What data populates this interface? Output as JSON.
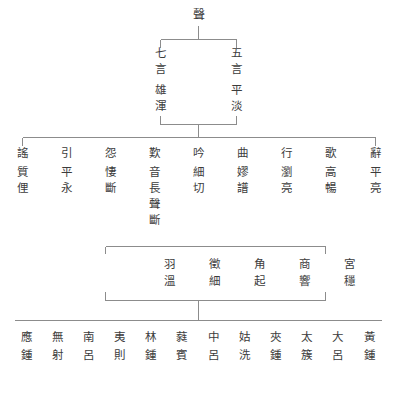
{
  "diagram": {
    "title": "聲",
    "type": "tree",
    "root": {
      "label": "聲",
      "chars": [
        "聲"
      ]
    },
    "level1": [
      {
        "label": "七言雄渾",
        "chars": [
          "七",
          "言",
          "雄",
          "渾"
        ]
      },
      {
        "label": "五言平淡",
        "chars": [
          "五",
          "言",
          "平",
          "淡"
        ]
      }
    ],
    "level2": [
      {
        "label": "謠質俚",
        "chars": [
          "謠",
          "質",
          "俚"
        ]
      },
      {
        "label": "引平永",
        "chars": [
          "引",
          "平",
          "永"
        ]
      },
      {
        "label": "怨悽斷",
        "chars": [
          "怨",
          "悽",
          "斷"
        ]
      },
      {
        "label": "歎音長聲斷",
        "chars": [
          "歎",
          "音",
          "長",
          "聲",
          "斷"
        ]
      },
      {
        "label": "吟細切",
        "chars": [
          "吟",
          "細",
          "切"
        ]
      },
      {
        "label": "曲嫪譜",
        "chars": [
          "曲",
          "嫪",
          "譜"
        ]
      },
      {
        "label": "行瀏亮",
        "chars": [
          "行",
          "瀏",
          "亮"
        ]
      },
      {
        "label": "歌高暢",
        "chars": [
          "歌",
          "高",
          "暢"
        ]
      },
      {
        "label": "辭平亮",
        "chars": [
          "辭",
          "平",
          "亮"
        ]
      }
    ],
    "level3": [
      {
        "label": "羽溫",
        "chars": [
          "羽",
          "溫"
        ]
      },
      {
        "label": "徵細",
        "chars": [
          "徵",
          "細"
        ]
      },
      {
        "label": "角起",
        "chars": [
          "角",
          "起"
        ]
      },
      {
        "label": "商響",
        "chars": [
          "商",
          "響"
        ]
      },
      {
        "label": "宮穩",
        "chars": [
          "宮",
          "穩"
        ]
      }
    ],
    "level4": [
      {
        "label": "應鍾",
        "chars": [
          "應",
          "鍾"
        ]
      },
      {
        "label": "無射",
        "chars": [
          "無",
          "射"
        ]
      },
      {
        "label": "南呂",
        "chars": [
          "南",
          "呂"
        ]
      },
      {
        "label": "夷則",
        "chars": [
          "夷",
          "則"
        ]
      },
      {
        "label": "林鍾",
        "chars": [
          "林",
          "鍾"
        ]
      },
      {
        "label": "蕤賓",
        "chars": [
          "蕤",
          "賓"
        ]
      },
      {
        "label": "中呂",
        "chars": [
          "中",
          "呂"
        ]
      },
      {
        "label": "姑洗",
        "chars": [
          "姑",
          "洗"
        ]
      },
      {
        "label": "夾鍾",
        "chars": [
          "夾",
          "鍾"
        ]
      },
      {
        "label": "太簇",
        "chars": [
          "太",
          "簇"
        ]
      },
      {
        "label": "大呂",
        "chars": [
          "大",
          "呂"
        ]
      },
      {
        "label": "黃鍾",
        "chars": [
          "黃",
          "鍾"
        ]
      }
    ],
    "colors": {
      "text": "#3c3c3c",
      "line": "#8c8c8c",
      "background": "#ffffff"
    }
  }
}
